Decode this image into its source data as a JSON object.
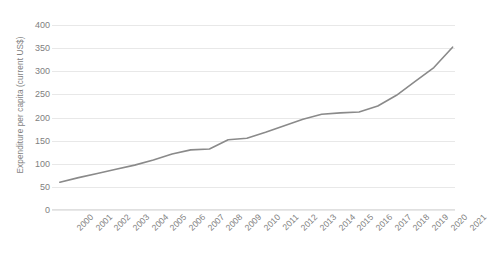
{
  "chart_data": {
    "type": "line",
    "title": "",
    "xlabel": "",
    "ylabel": "Expenditure per capita (current US$)",
    "categories": [
      "2000",
      "2001",
      "2002",
      "2003",
      "2004",
      "2005",
      "2006",
      "2007",
      "2008",
      "2009",
      "2010",
      "2011",
      "2012",
      "2013",
      "2014",
      "2015",
      "2016",
      "2017",
      "2018",
      "2019",
      "2020",
      "2021"
    ],
    "values": [
      60,
      70,
      79,
      88,
      97,
      108,
      121,
      130,
      132,
      152,
      155,
      168,
      182,
      196,
      207,
      210,
      212,
      225,
      248,
      278,
      308,
      352
    ],
    "series": [
      {
        "name": "Expenditure per capita (current US$)",
        "values": [
          60,
          70,
          79,
          88,
          97,
          108,
          121,
          130,
          132,
          152,
          155,
          168,
          182,
          196,
          207,
          210,
          212,
          225,
          248,
          278,
          308,
          352
        ],
        "color": "#8a8a8a"
      }
    ],
    "ylim": [
      0,
      400
    ],
    "yticks": [
      0,
      50,
      100,
      150,
      200,
      250,
      300,
      350,
      400
    ],
    "ytick_labels": [
      "0",
      "50",
      "100",
      "150",
      "200",
      "250",
      "300",
      "350",
      "400"
    ],
    "grid": true,
    "grid_axis": "y",
    "legend": false,
    "legend_position": "none",
    "line_color": "#8a8a8a",
    "gridline_color": "#e8e8e8",
    "text_color": "#808080",
    "background_color": "#ffffff",
    "markers": false,
    "line_width": 1.6
  }
}
